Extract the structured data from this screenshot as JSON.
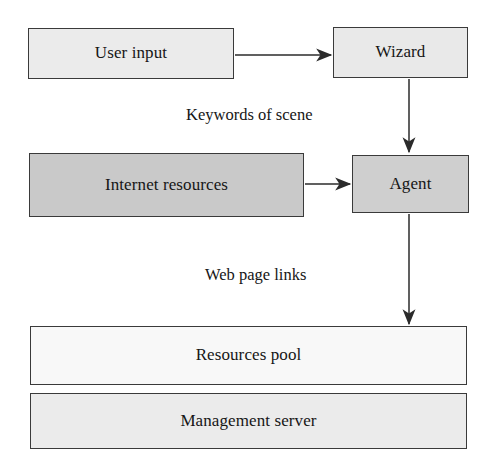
{
  "diagram": {
    "type": "flow-diagram",
    "background_color": "#ffffff",
    "nodes": [
      {
        "id": "user-input",
        "label": "User input",
        "fill": "#ebebeb",
        "border": "#3a3a3a"
      },
      {
        "id": "wizard",
        "label": "Wizard",
        "fill": "#e9e9e9",
        "border": "#3a3a3a"
      },
      {
        "id": "internet-resources",
        "label": "Internet resources",
        "fill": "#c9c9c9",
        "border": "#3a3a3a"
      },
      {
        "id": "agent",
        "label": "Agent",
        "fill": "#cfcfcf",
        "border": "#3a3a3a"
      },
      {
        "id": "resources-pool",
        "label": "Resources pool",
        "fill": "#f8f8f8",
        "border": "#3a3a3a"
      },
      {
        "id": "management-server",
        "label": "Management server",
        "fill": "#ebebeb",
        "border": "#3a3a3a"
      }
    ],
    "edges": [
      {
        "id": "user-input-to-wizard",
        "from": "user-input",
        "to": "wizard",
        "label": "",
        "direction": "right"
      },
      {
        "id": "wizard-to-agent",
        "from": "wizard",
        "to": "agent",
        "label": "Keywords of scene",
        "direction": "down"
      },
      {
        "id": "internet-resources-to-agent",
        "from": "internet-resources",
        "to": "agent",
        "label": "",
        "direction": "right"
      },
      {
        "id": "agent-to-resources-pool",
        "from": "agent",
        "to": "resources-pool",
        "label": "Web page links",
        "direction": "down"
      }
    ],
    "edge_labels": {
      "keywords": "Keywords of scene",
      "weblinks": "Web page links"
    },
    "arrow_color": "#2b2b2b"
  }
}
